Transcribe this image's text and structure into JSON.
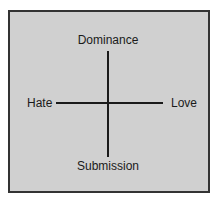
{
  "diagram": {
    "type": "two-axis-model",
    "vertical_axis": {
      "top_label": "Dominance",
      "bottom_label": "Submission"
    },
    "horizontal_axis": {
      "left_label": "Hate",
      "right_label": "Love"
    },
    "colors": {
      "background": "#d0d0d0",
      "border": "#333333",
      "axis": "#1a1a1a",
      "text": "#1a1a1a"
    }
  }
}
